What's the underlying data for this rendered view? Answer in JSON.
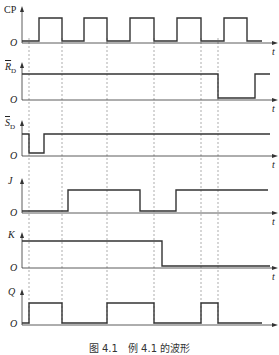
{
  "diagram": {
    "type": "timing-diagram",
    "signals": [
      {
        "name": "CP",
        "label": "CP",
        "overbar": false,
        "transitions_x": [
          22,
          39,
          62,
          84,
          107,
          130,
          154,
          177,
          201,
          224,
          247
        ],
        "levels": [
          0,
          1,
          0,
          1,
          0,
          1,
          0,
          1,
          0,
          1,
          0
        ]
      },
      {
        "name": "RD_bar",
        "label": "R",
        "subscript": "D",
        "overbar": true,
        "transitions_x": [
          22,
          218,
          255
        ],
        "levels": [
          1,
          0,
          1
        ]
      },
      {
        "name": "SD_bar",
        "label": "S",
        "subscript": "D",
        "overbar": true,
        "transitions_x": [
          22,
          29,
          44
        ],
        "levels": [
          1,
          0,
          1
        ]
      },
      {
        "name": "J",
        "label": "J",
        "overbar": false,
        "transitions_x": [
          22,
          68,
          140,
          176
        ],
        "levels": [
          0,
          1,
          0,
          1
        ]
      },
      {
        "name": "K",
        "label": "K",
        "overbar": false,
        "transitions_x": [
          22,
          162
        ],
        "levels": [
          1,
          0
        ]
      },
      {
        "name": "Q",
        "label": "Q",
        "overbar": false,
        "transitions_x": [
          22,
          29,
          62,
          107,
          154,
          201,
          218
        ],
        "levels": [
          0,
          1,
          0,
          1,
          0,
          1,
          0
        ]
      }
    ],
    "dashed_guides_x": [
      29,
      62,
      107,
      154,
      201,
      218
    ],
    "origin_label": "O",
    "time_label": "t",
    "caption": "图 4.1　例 4.1 的波形",
    "colors": {
      "line": "#333333",
      "guide": "#777777",
      "background": "#ffffff"
    }
  }
}
